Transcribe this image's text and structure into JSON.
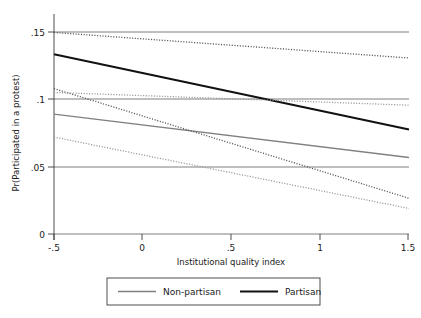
{
  "chart_data": {
    "type": "line",
    "title": "",
    "xlabel": "Institutional quality index",
    "ylabel": "Pr(Participated in a protest)",
    "xlim": [
      -0.5,
      1.5
    ],
    "ylim": [
      0,
      0.1725
    ],
    "xticks": [
      -0.5,
      0,
      0.5,
      1,
      1.5
    ],
    "xticklabels": [
      "-.5",
      "0",
      ".5",
      "1",
      "1.5"
    ],
    "yticks": [
      0,
      0.05,
      0.1,
      0.15
    ],
    "yticklabels": [
      "0",
      ".05",
      ".1",
      ".15"
    ],
    "grid": "horizontal",
    "legend_position": "bottom",
    "series": [
      {
        "name": "Non-partisan",
        "style": "solid",
        "color": "#808080",
        "width": 1.4,
        "x": [
          -0.5,
          1.5
        ],
        "values": [
          0.094,
          0.06
        ]
      },
      {
        "name": "Partisan",
        "style": "solid",
        "color": "#111111",
        "width": 2.0,
        "x": [
          -0.5,
          1.5
        ],
        "values": [
          0.141,
          0.082
        ]
      },
      {
        "name": "Partisan CI upper",
        "style": "dotted",
        "color": "#555555",
        "width": 1.3,
        "x": [
          -0.5,
          1.5
        ],
        "values": [
          0.158,
          0.138
        ],
        "in_legend": false
      },
      {
        "name": "Partisan CI lower",
        "style": "dotted",
        "color": "#555555",
        "width": 1.3,
        "x": [
          -0.5,
          1.5
        ],
        "values": [
          0.114,
          0.028
        ],
        "in_legend": false
      },
      {
        "name": "Non-partisan CI upper",
        "style": "dotted",
        "color": "#999999",
        "width": 1.3,
        "x": [
          -0.5,
          1.5
        ],
        "values": [
          0.111,
          0.101
        ],
        "in_legend": false
      },
      {
        "name": "Non-partisan CI lower",
        "style": "dotted",
        "color": "#999999",
        "width": 1.3,
        "x": [
          -0.5,
          1.5
        ],
        "values": [
          0.076,
          0.02
        ],
        "in_legend": false
      }
    ],
    "legend": [
      {
        "label": "Non-partisan",
        "color": "#808080",
        "width": 1.4
      },
      {
        "label": "Partisan",
        "color": "#111111",
        "width": 2.2
      }
    ]
  },
  "colors": {
    "gridline": "#6f6f6f",
    "axis": "#3a3a3a",
    "text": "#1a1a1a",
    "legend_border": "#3a3a3a",
    "background": "#ffffff"
  }
}
